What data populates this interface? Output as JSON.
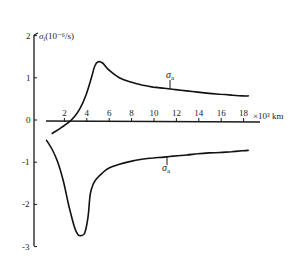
{
  "chart_data": {
    "type": "line",
    "title": "",
    "ylabel": "σ_i (10⁻⁶/s)",
    "xlabel": "×10³ km",
    "xlim": [
      0,
      19
    ],
    "ylim": [
      -3,
      2
    ],
    "grid": false,
    "legend": "none (curves labeled inline)",
    "x_ticks": [
      2,
      4,
      6,
      8,
      10,
      12,
      14,
      16,
      18
    ],
    "y_ticks": [
      2,
      1,
      0,
      -1,
      -2,
      -3
    ],
    "series": [
      {
        "name": "σ_a (upper)",
        "x": [
          1.0,
          1.8,
          2.5,
          3.0,
          3.5,
          4.0,
          4.5,
          4.8,
          5.1,
          5.5,
          6.0,
          7.0,
          8.0,
          9.0,
          10.0,
          11.0,
          12.0,
          13.0,
          14.0,
          15.0,
          16.0,
          17.0,
          18.0,
          18.5
        ],
        "y": [
          -0.32,
          -0.18,
          -0.05,
          0.08,
          0.28,
          0.58,
          1.0,
          1.28,
          1.38,
          1.35,
          1.2,
          1.0,
          0.9,
          0.83,
          0.78,
          0.75,
          0.72,
          0.69,
          0.66,
          0.63,
          0.61,
          0.59,
          0.57,
          0.57
        ]
      },
      {
        "name": "σ_a (lower)",
        "x": [
          0.5,
          1.0,
          1.5,
          2.0,
          2.5,
          3.0,
          3.3,
          3.6,
          3.9,
          4.2,
          4.4,
          4.7,
          5.0,
          5.5,
          6.0,
          7.0,
          8.0,
          9.0,
          10.0,
          11.0,
          12.0,
          13.0,
          14.0,
          15.0,
          16.0,
          17.0,
          18.0,
          18.5
        ],
        "y": [
          -0.48,
          -0.7,
          -1.0,
          -1.45,
          -2.05,
          -2.55,
          -2.72,
          -2.74,
          -2.68,
          -2.3,
          -1.75,
          -1.5,
          -1.38,
          -1.25,
          -1.15,
          -1.05,
          -0.98,
          -0.93,
          -0.9,
          -0.88,
          -0.85,
          -0.83,
          -0.8,
          -0.78,
          -0.77,
          -0.75,
          -0.73,
          -0.72
        ]
      }
    ],
    "annotations": [
      {
        "text": "σ_a",
        "x": 11.5,
        "y": 0.72,
        "position": "above upper curve"
      },
      {
        "text": "σ_a",
        "x": 11.5,
        "y": -0.88,
        "position": "below lower curve"
      }
    ]
  },
  "labels": {
    "y_title": "σ",
    "y_title_sub": "i",
    "y_title_unit": "(10⁻⁶/s)",
    "x_unit": "×10³ km",
    "upper_curve": "σ",
    "upper_curve_sub": "a",
    "lower_curve": "σ",
    "lower_curve_sub": "a"
  }
}
